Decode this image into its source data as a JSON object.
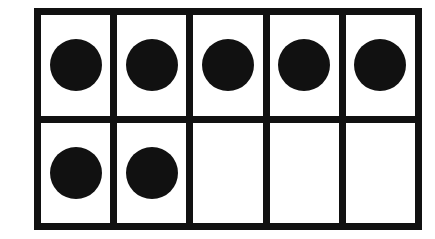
{
  "ten_frame": {
    "rows": 2,
    "columns": 5,
    "filled_count": 7,
    "counter_color": "#111111",
    "cells": [
      {
        "filled": true
      },
      {
        "filled": true
      },
      {
        "filled": true
      },
      {
        "filled": true
      },
      {
        "filled": true
      },
      {
        "filled": true
      },
      {
        "filled": true
      },
      {
        "filled": false
      },
      {
        "filled": false
      },
      {
        "filled": false
      }
    ]
  }
}
